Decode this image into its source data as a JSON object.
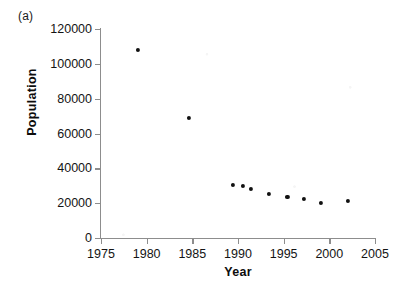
{
  "figure": {
    "panel_label": "(a)",
    "background_color": "#ffffff"
  },
  "chart_data": {
    "type": "scatter",
    "title": "",
    "subtitle": "",
    "xlabel": "Year",
    "ylabel": "Population",
    "xlim": [
      1975,
      2005
    ],
    "ylim": [
      0,
      120000
    ],
    "xticks": [
      1975,
      1980,
      1985,
      1990,
      1995,
      2000,
      2005
    ],
    "xtick_labels": [
      "1975",
      "1980",
      "1985",
      "1990",
      "1995",
      "2000",
      "2005"
    ],
    "yticks": [
      0,
      20000,
      40000,
      60000,
      80000,
      100000,
      120000
    ],
    "ytick_labels": [
      "0",
      "20000",
      "40000",
      "60000",
      "80000",
      "100000",
      "120000"
    ],
    "grid": false,
    "legend": false,
    "legend_position": "none",
    "marker": "filled-circle",
    "marker_color": "#111111",
    "marker_size_px": 4.2,
    "axis_color": "#8d8d8d",
    "series": [
      {
        "name": "Population",
        "x": [
          1979,
          1984.6,
          1989.4,
          1990.5,
          1991.4,
          1993.4,
          1995.4,
          1997.2,
          1999.1,
          2002.0
        ],
        "values": [
          108000,
          68900,
          30400,
          29900,
          28100,
          25300,
          23500,
          22400,
          20100,
          21200
        ]
      }
    ],
    "points": [
      {
        "x": 1979.0,
        "y": 108000
      },
      {
        "x": 1984.6,
        "y": 68900
      },
      {
        "x": 1989.4,
        "y": 30400
      },
      {
        "x": 1990.5,
        "y": 29900
      },
      {
        "x": 1991.4,
        "y": 28100
      },
      {
        "x": 1993.4,
        "y": 25300
      },
      {
        "x": 1995.4,
        "y": 23500
      },
      {
        "x": 1997.2,
        "y": 22400
      },
      {
        "x": 1999.1,
        "y": 20100
      },
      {
        "x": 2002.0,
        "y": 21200
      }
    ]
  }
}
